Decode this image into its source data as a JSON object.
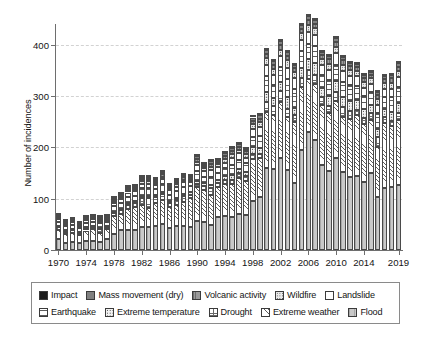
{
  "chart_data": {
    "type": "bar",
    "subtype": "stacked",
    "title": "",
    "xlabel": "",
    "ylabel": "Number of incidences",
    "ylim": [
      0,
      440
    ],
    "yticks": [
      0,
      100,
      200,
      300,
      400
    ],
    "ytick_labels": [
      "0",
      "100",
      "200",
      "300",
      "400"
    ],
    "grid": true,
    "grid_axis": "y",
    "legend_position": "bottom",
    "xtick_labels": [
      "1970",
      "1974",
      "1978",
      "1982",
      "1986",
      "1990",
      "1994",
      "1998",
      "2002",
      "2006",
      "2010",
      "2014",
      "2019"
    ],
    "xticks": [
      1970,
      1974,
      1978,
      1982,
      1986,
      1990,
      1994,
      1998,
      2002,
      2006,
      2010,
      2014,
      2019
    ],
    "categories": [
      1970,
      1971,
      1972,
      1973,
      1974,
      1975,
      1976,
      1977,
      1978,
      1979,
      1980,
      1981,
      1982,
      1983,
      1984,
      1985,
      1986,
      1987,
      1988,
      1989,
      1990,
      1991,
      1992,
      1993,
      1994,
      1995,
      1996,
      1997,
      1998,
      1999,
      2000,
      2001,
      2002,
      2003,
      2004,
      2005,
      2006,
      2007,
      2008,
      2009,
      2010,
      2011,
      2012,
      2013,
      2014,
      2015,
      2016,
      2017,
      2018,
      2019
    ],
    "series": [
      {
        "name": "Flood",
        "key": "flood",
        "fill": "flood",
        "values": [
          21,
          13,
          15,
          13,
          18,
          18,
          16,
          21,
          32,
          38,
          39,
          39,
          45,
          44,
          47,
          50,
          43,
          46,
          47,
          45,
          56,
          54,
          48,
          64,
          66,
          65,
          71,
          68,
          96,
          104,
          160,
          158,
          179,
          156,
          130,
          195,
          229,
          214,
          165,
          154,
          180,
          152,
          143,
          144,
          133,
          149,
          103,
          120,
          123,
          127
        ]
      },
      {
        "name": "Extreme weather",
        "key": "extreme_weather",
        "fill": "extremeweather",
        "values": [
          18,
          18,
          18,
          17,
          20,
          22,
          18,
          19,
          34,
          33,
          40,
          44,
          42,
          38,
          44,
          48,
          40,
          42,
          46,
          56,
          67,
          62,
          59,
          59,
          62,
          63,
          70,
          66,
          81,
          75,
          109,
          105,
          110,
          103,
          119,
          123,
          104,
          109,
          118,
          112,
          110,
          107,
          112,
          118,
          113,
          105,
          97,
          128,
          118,
          127
        ]
      },
      {
        "name": "Drought",
        "key": "drought",
        "fill": "drought",
        "values": [
          5,
          5,
          6,
          4,
          5,
          5,
          7,
          5,
          6,
          6,
          9,
          9,
          14,
          20,
          13,
          11,
          9,
          9,
          12,
          6,
          5,
          8,
          13,
          8,
          8,
          9,
          8,
          11,
          10,
          8,
          19,
          18,
          21,
          15,
          13,
          16,
          17,
          17,
          15,
          15,
          18,
          19,
          15,
          10,
          11,
          13,
          21,
          11,
          10,
          13
        ]
      },
      {
        "name": "Extreme temperature",
        "key": "extreme_temperature",
        "fill": "extremetemp",
        "values": [
          2,
          2,
          2,
          2,
          2,
          2,
          2,
          2,
          2,
          3,
          3,
          3,
          4,
          4,
          3,
          4,
          4,
          4,
          5,
          6,
          6,
          6,
          6,
          5,
          8,
          9,
          9,
          7,
          13,
          12,
          19,
          15,
          17,
          24,
          15,
          20,
          21,
          24,
          17,
          19,
          22,
          20,
          21,
          20,
          17,
          15,
          15,
          15,
          17,
          20
        ]
      },
      {
        "name": "Earthquake",
        "key": "earthquake",
        "fill": "earthquake",
        "values": [
          9,
          8,
          8,
          6,
          8,
          8,
          9,
          7,
          11,
          12,
          13,
          11,
          15,
          14,
          12,
          15,
          12,
          13,
          13,
          11,
          19,
          13,
          17,
          14,
          15,
          20,
          18,
          17,
          20,
          23,
          32,
          26,
          29,
          35,
          37,
          33,
          31,
          34,
          26,
          31,
          31,
          30,
          30,
          28,
          25,
          26,
          30,
          23,
          29,
          31
        ]
      },
      {
        "name": "Landslide",
        "key": "landslide",
        "fill": "landslide",
        "values": [
          5,
          4,
          5,
          4,
          5,
          5,
          5,
          5,
          6,
          7,
          8,
          8,
          9,
          9,
          8,
          10,
          8,
          9,
          9,
          8,
          12,
          10,
          12,
          11,
          11,
          13,
          12,
          11,
          16,
          17,
          21,
          19,
          21,
          22,
          20,
          22,
          23,
          21,
          19,
          20,
          22,
          21,
          18,
          18,
          17,
          16,
          17,
          16,
          17,
          18
        ]
      },
      {
        "name": "Wildfire",
        "key": "wildfire",
        "fill": "wildfire",
        "values": [
          2,
          2,
          2,
          2,
          2,
          2,
          2,
          2,
          3,
          3,
          4,
          4,
          5,
          5,
          4,
          5,
          4,
          5,
          5,
          5,
          7,
          6,
          7,
          6,
          7,
          8,
          7,
          7,
          9,
          10,
          13,
          12,
          13,
          14,
          12,
          13,
          14,
          13,
          11,
          12,
          13,
          12,
          12,
          11,
          11,
          10,
          11,
          12,
          12,
          13
        ]
      },
      {
        "name": "Volcanic activity",
        "key": "volcanic_activity",
        "fill": "volcanic",
        "values": [
          3,
          2,
          3,
          2,
          3,
          3,
          3,
          3,
          4,
          4,
          4,
          4,
          5,
          5,
          4,
          5,
          4,
          5,
          5,
          4,
          6,
          5,
          6,
          5,
          6,
          6,
          6,
          5,
          7,
          7,
          9,
          8,
          9,
          9,
          8,
          9,
          9,
          9,
          8,
          8,
          9,
          8,
          8,
          8,
          7,
          7,
          8,
          7,
          8,
          8
        ]
      },
      {
        "name": "Mass movement (dry)",
        "key": "mass_movement_dry",
        "fill": "massmovement",
        "values": [
          3,
          2,
          2,
          2,
          2,
          2,
          2,
          2,
          3,
          3,
          3,
          3,
          4,
          4,
          3,
          4,
          3,
          4,
          4,
          3,
          5,
          4,
          5,
          4,
          5,
          5,
          5,
          4,
          6,
          6,
          7,
          7,
          7,
          7,
          6,
          7,
          8,
          7,
          6,
          7,
          7,
          7,
          6,
          6,
          6,
          6,
          6,
          6,
          6,
          7
        ]
      },
      {
        "name": "Impact",
        "key": "impact",
        "fill": "impact",
        "values": [
          2,
          1,
          1,
          1,
          1,
          1,
          1,
          1,
          2,
          2,
          2,
          2,
          2,
          2,
          2,
          2,
          2,
          2,
          2,
          2,
          3,
          2,
          3,
          2,
          3,
          3,
          3,
          2,
          3,
          3,
          4,
          4,
          4,
          4,
          3,
          4,
          4,
          4,
          3,
          4,
          4,
          4,
          3,
          3,
          3,
          3,
          3,
          3,
          3,
          4
        ]
      }
    ],
    "totals": [
      70,
      57,
      62,
      53,
      66,
      68,
      65,
      67,
      103,
      111,
      125,
      127,
      145,
      145,
      136,
      154,
      129,
      138,
      148,
      146,
      186,
      170,
      176,
      178,
      191,
      201,
      209,
      198,
      261,
      265,
      393,
      372,
      410,
      389,
      363,
      442,
      460,
      452,
      388,
      382,
      416,
      380,
      368,
      366,
      343,
      350,
      311,
      341,
      343,
      368
    ]
  },
  "legend": {
    "rows": [
      [
        {
          "label": "Impact",
          "fill": "impact"
        },
        {
          "label": "Mass movement (dry)",
          "fill": "massmovement"
        },
        {
          "label": "Volcanic activity",
          "fill": "volcanic"
        },
        {
          "label": "Wildfire",
          "fill": "wildfire"
        },
        {
          "label": "Landslide",
          "fill": "landslide"
        }
      ],
      [
        {
          "label": "Earthquake",
          "fill": "earthquake"
        },
        {
          "label": "Extreme temperature",
          "fill": "extremetemp"
        },
        {
          "label": "Drought",
          "fill": "drought"
        },
        {
          "label": "Extreme weather",
          "fill": "extremeweather"
        },
        {
          "label": "Flood",
          "fill": "flood"
        }
      ]
    ]
  }
}
